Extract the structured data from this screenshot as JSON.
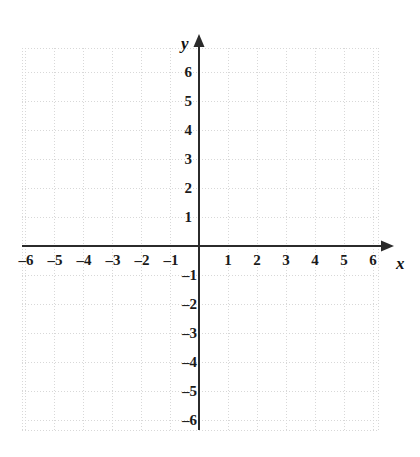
{
  "chart_data": {
    "type": "scatter",
    "title": "",
    "subtitle": "",
    "xlabel": "x",
    "ylabel": "y",
    "xlim": [
      -6.1,
      6.2
    ],
    "ylim": [
      -6.3,
      6.6
    ],
    "xticks": [
      -6,
      -5,
      -4,
      -3,
      -2,
      -1,
      1,
      2,
      3,
      4,
      5,
      6
    ],
    "yticks": [
      6,
      5,
      4,
      3,
      2,
      1,
      -1,
      -2,
      -3,
      -4,
      -5,
      -6
    ],
    "xtick_labels": [
      "–6",
      "–5",
      "–4",
      "–3",
      "–2",
      "–1",
      "1",
      "2",
      "3",
      "4",
      "5",
      "6"
    ],
    "ytick_labels_positive": [
      "6",
      "5",
      "4",
      "3",
      "2",
      "1"
    ],
    "ytick_labels_negative": [
      "–1",
      "–2",
      "–3",
      "–4",
      "–5",
      "–6"
    ],
    "grid": true,
    "grid_style": "dotted",
    "legend": null,
    "series": [],
    "values": [],
    "annotations": [],
    "x_axis_arrow": "right",
    "y_axis_arrow": "up"
  },
  "colors": {
    "background": "#ffffff",
    "axis": "#2b2b2b",
    "grid_minor": "#d8d8d8",
    "grid_major": "#c9c9c9",
    "label": "#1a1a1a"
  },
  "geometry": {
    "origin_x": 199,
    "origin_y": 246,
    "unit": 29.0,
    "grid_left": 22,
    "grid_right": 378,
    "grid_top": 48,
    "grid_bottom": 430
  },
  "labels": {
    "x_axis_name": "x",
    "y_axis_name": "y"
  }
}
